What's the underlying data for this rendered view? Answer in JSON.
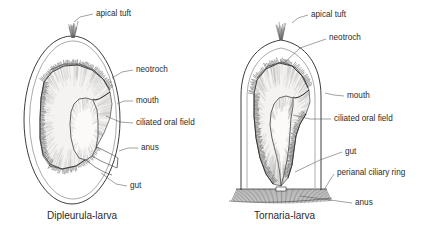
{
  "figure": {
    "background_color": "#ffffff",
    "ink_color": "#1a1a1a",
    "label_color": "#2b2b2b",
    "leader_color": "#555555"
  },
  "panels": [
    {
      "id": "dipleurula",
      "caption": "Dipleurula-larva",
      "caption_pos": {
        "x": 47,
        "y": 216
      },
      "body_shape": "ovoid",
      "labels": [
        {
          "name": "apical-tuft",
          "text": "apical tuft",
          "x": 96,
          "y": 14,
          "leader": [
            [
              93,
              14
            ],
            [
              80,
              17
            ],
            [
              74,
              22
            ]
          ]
        },
        {
          "name": "neotroch",
          "text": "neotroch",
          "x": 136,
          "y": 70,
          "leader": [
            [
              133,
              70
            ],
            [
              122,
              72
            ],
            [
              112,
              78
            ]
          ]
        },
        {
          "name": "mouth",
          "text": "mouth",
          "x": 136,
          "y": 101,
          "leader": [
            [
              133,
              101
            ],
            [
              124,
              101
            ],
            [
              117,
              104
            ]
          ]
        },
        {
          "name": "ciliated-oral-field",
          "text": "ciliated oral field",
          "x": 136,
          "y": 123,
          "leader": [
            [
              133,
              123
            ],
            [
              120,
              122
            ],
            [
              106,
              116
            ]
          ]
        },
        {
          "name": "anus",
          "text": "anus",
          "x": 141,
          "y": 148,
          "leader": [
            [
              138,
              148
            ],
            [
              128,
              148
            ],
            [
              119,
              151
            ]
          ]
        },
        {
          "name": "gut",
          "text": "gut",
          "x": 130,
          "y": 186,
          "leader": [
            [
              127,
              186
            ],
            [
              116,
              184
            ],
            [
              101,
              173
            ]
          ]
        }
      ]
    },
    {
      "id": "tornaria",
      "caption": "Tornaria-larva",
      "caption_pos": {
        "x": 254,
        "y": 216
      },
      "body_shape": "bell",
      "labels": [
        {
          "name": "apical-tuft",
          "text": "apical tuft",
          "x": 311,
          "y": 15,
          "leader": [
            [
              308,
              15
            ],
            [
              298,
              18
            ],
            [
              292,
              23
            ]
          ]
        },
        {
          "name": "neotroch",
          "text": "neotroch",
          "x": 329,
          "y": 38,
          "leader": [
            [
              326,
              39
            ],
            [
              300,
              48
            ],
            [
              283,
              64
            ]
          ]
        },
        {
          "name": "mouth",
          "text": "mouth",
          "x": 347,
          "y": 96,
          "leader": [
            [
              344,
              96
            ],
            [
              334,
              95
            ],
            [
              325,
              93
            ]
          ]
        },
        {
          "name": "ciliated-oral-field",
          "text": "ciliated oral field",
          "x": 334,
          "y": 119,
          "leader": [
            [
              331,
              119
            ],
            [
              310,
              119
            ],
            [
              293,
              115
            ]
          ]
        },
        {
          "name": "gut",
          "text": "gut",
          "x": 345,
          "y": 152,
          "leader": [
            [
              342,
              152
            ],
            [
              320,
              160
            ],
            [
              295,
              172
            ]
          ]
        },
        {
          "name": "perianal-ciliary-ring",
          "text": "perianal ciliary ring",
          "x": 337,
          "y": 173,
          "leader": [
            [
              334,
              174
            ],
            [
              330,
              180
            ],
            [
              324,
              190
            ]
          ]
        },
        {
          "name": "anus",
          "text": "anus",
          "x": 355,
          "y": 203,
          "leader": [
            [
              352,
              203
            ],
            [
              330,
              200
            ],
            [
              300,
              196
            ]
          ]
        }
      ]
    }
  ],
  "structures": {
    "apical_tuft": "apical tuft",
    "neotroch": "neotroch",
    "mouth": "mouth",
    "ciliated_oral_field": "ciliated oral field",
    "anus": "anus",
    "gut": "gut",
    "perianal_ciliary_ring": "perianal ciliary ring"
  }
}
